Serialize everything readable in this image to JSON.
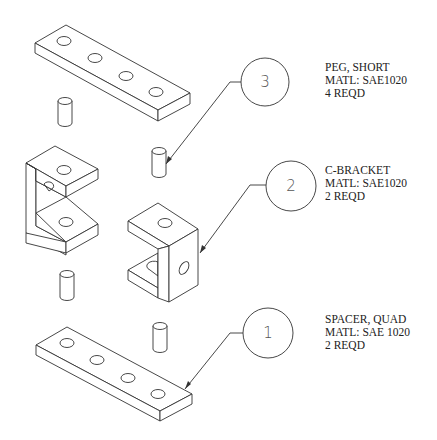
{
  "drawing": {
    "type": "exploded isometric assembly drawing",
    "line_color": "#333333",
    "background": "#ffffff"
  },
  "balloons": [
    {
      "number": "3",
      "part": "peg"
    },
    {
      "number": "2",
      "part": "c-bracket"
    },
    {
      "number": "1",
      "part": "spacer"
    }
  ],
  "notes": {
    "peg": {
      "line1": "PEG, SHORT",
      "line2": "MATL: SAE1020",
      "line3": "4 REQD"
    },
    "c_bracket": {
      "line1": "C-BRACKET",
      "line2": "MATL: SAE1020",
      "line3": "2 REQD"
    },
    "spacer": {
      "line1": "SPACER, QUAD",
      "line2": "MATL: SAE 1020",
      "line3": "2 REQD"
    }
  },
  "parts_shown": {
    "spacer_quad_count": 2,
    "c_bracket_count": 2,
    "peg_short_count": 4,
    "holes_per_spacer": 4
  }
}
